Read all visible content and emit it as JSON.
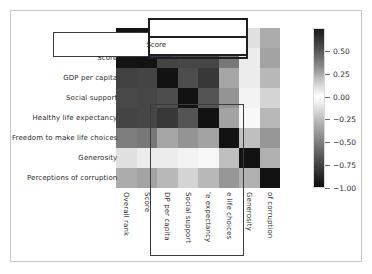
{
  "figure": {
    "background": "#ffffff",
    "border_color": "#c8c8c8"
  },
  "chart_data": {
    "type": "heatmap",
    "title": "",
    "xlabel": "",
    "ylabel": "",
    "grid": false,
    "legend_position": "right",
    "colorbar": {
      "ticks": [
        "0.50",
        "0.25",
        "0.00",
        "-0.25",
        "-0.50",
        "-0.75",
        "-1.00"
      ],
      "tick_values": [
        0.5,
        0.25,
        0.0,
        -0.25,
        -0.5,
        -0.75,
        -1.0
      ],
      "vmin": -1.0,
      "vmax": 0.75,
      "colormap": "diverging-gray"
    },
    "categories": [
      "Overall rank",
      "Score",
      "GDP per capita",
      "Social support",
      "Healthy life expectancy",
      "Freedom to make life choices",
      "Generosity",
      "Perceptions of corruption"
    ],
    "x_tick_labels": [
      "Overall rank",
      "Score",
      "DP per capita",
      "Social support",
      "'e expectancy",
      "e life choices",
      "Generosity",
      "of corruption"
    ],
    "y_tick_labels": [
      "",
      "Score",
      "GDP per capita",
      "Social support",
      "Healthy life expectancy",
      "Freedom to make life choices",
      "Generosity",
      "Perceptions of corruption"
    ],
    "matrix": [
      [
        1.0,
        -0.99,
        -0.8,
        -0.77,
        -0.79,
        -0.55,
        -0.13,
        -0.35
      ],
      [
        -0.99,
        1.0,
        0.79,
        0.78,
        0.78,
        0.57,
        0.08,
        0.39
      ],
      [
        -0.8,
        0.79,
        1.0,
        0.75,
        0.84,
        0.38,
        -0.08,
        0.3
      ],
      [
        -0.77,
        0.78,
        0.75,
        1.0,
        0.72,
        0.45,
        -0.05,
        0.18
      ],
      [
        -0.79,
        0.78,
        0.84,
        0.72,
        1.0,
        0.39,
        -0.03,
        0.3
      ],
      [
        -0.55,
        0.57,
        0.38,
        0.45,
        0.39,
        1.0,
        0.27,
        0.44
      ],
      [
        -0.13,
        0.08,
        -0.08,
        -0.05,
        -0.03,
        0.27,
        1.0,
        0.33
      ],
      [
        -0.35,
        0.39,
        0.3,
        0.18,
        0.3,
        0.44,
        0.33,
        1.0
      ]
    ]
  },
  "annotations": [
    {
      "name": "score-row-highlight",
      "label": "Score"
    },
    {
      "name": "top-columns-highlight",
      "label": ""
    },
    {
      "name": "vertical-columns-highlight",
      "label": ""
    }
  ]
}
